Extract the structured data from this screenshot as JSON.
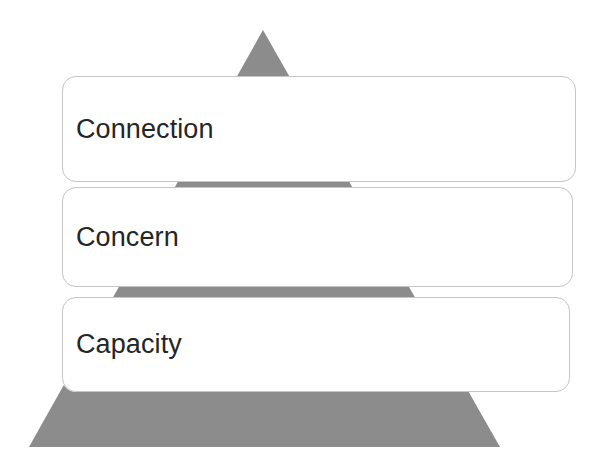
{
  "diagram": {
    "type": "pyramid",
    "title": "",
    "shape_name": "triangle-pyramid",
    "colors": {
      "pyramid_fill": "#8c8c8c",
      "pyramid_overlay": "#f7f7f7",
      "box_border": "#c6c6c6",
      "box_fill": "#ffffff",
      "text": "#252525",
      "background": "#ffffff"
    },
    "geometry": {
      "apex_x": 263,
      "apex_y": 30,
      "base_left_x": 29,
      "base_right_x": 500,
      "base_y": 447
    },
    "levels": [
      {
        "label": "Connection",
        "order": 1,
        "position": "top"
      },
      {
        "label": "Concern",
        "order": 2,
        "position": "middle"
      },
      {
        "label": "Capacity",
        "order": 3,
        "position": "bottom"
      }
    ]
  }
}
